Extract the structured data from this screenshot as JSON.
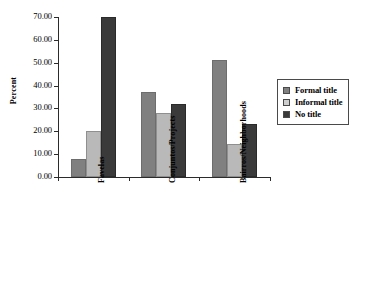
{
  "chart_data": {
    "type": "bar",
    "title": "",
    "subtitle": "",
    "xlabel": "",
    "ylabel": "Percent",
    "ylim": [
      0,
      70
    ],
    "ytick_step": 10,
    "ytick_labels": [
      "0.00",
      "10.00",
      "20.00",
      "30.00",
      "40.00",
      "50.00",
      "60.00",
      "70.00"
    ],
    "ytick_values": [
      0,
      10,
      20,
      30,
      40,
      50,
      60,
      70
    ],
    "grid": false,
    "legend_position": "right",
    "categories": [
      "Favelas",
      "Conjuntos/Projects",
      "Bairros/Neighborhoods"
    ],
    "series": [
      {
        "name": "Formal title",
        "color": "#808080",
        "values": [
          8.0,
          37.0,
          51.0
        ]
      },
      {
        "name": "Informal title",
        "color": "#b9b9b9",
        "values": [
          20.0,
          28.0,
          14.5
        ]
      },
      {
        "name": "No title",
        "color": "#3a3a3a",
        "values": [
          70.0,
          32.0,
          23.0
        ]
      }
    ]
  },
  "legend": {
    "entries": [
      {
        "label": "Formal title"
      },
      {
        "label": "Informal title"
      },
      {
        "label": "No title"
      }
    ]
  }
}
